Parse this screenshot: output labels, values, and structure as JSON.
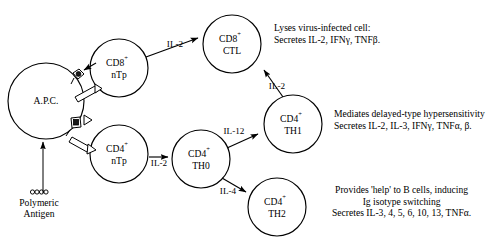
{
  "diagram": {
    "cells": [
      {
        "id": "apc",
        "name": "A.P.C.",
        "line1": "A.P.C.",
        "line2": "",
        "cx": 46,
        "cy": 101,
        "r": 38
      },
      {
        "id": "cd8ntp",
        "name": "CD8+ nTp",
        "line1": "CD8",
        "sup1": "+",
        "line2": "nTp",
        "cx": 119,
        "cy": 68,
        "r": 29
      },
      {
        "id": "cd4ntp",
        "name": "CD4+ nTp",
        "line1": "CD4",
        "sup1": "+",
        "line2": "nTp",
        "cx": 119,
        "cy": 154,
        "r": 29
      },
      {
        "id": "cd8ctl",
        "name": "CD8+ CTL",
        "line1": "CD8",
        "sup1": "+",
        "line2": "CTL",
        "cx": 232,
        "cy": 44,
        "r": 29
      },
      {
        "id": "cd4th0",
        "name": "CD4+ TH0",
        "line1": "CD4",
        "sup1": "+",
        "line2": "TH0",
        "cx": 201,
        "cy": 159,
        "r": 29
      },
      {
        "id": "cd4th1",
        "name": "CD4+ TH1",
        "line1": "CD4",
        "sup1": "+",
        "line2": "TH1",
        "cx": 293,
        "cy": 124,
        "r": 29
      },
      {
        "id": "cd4th2",
        "name": "CD4+ TH2",
        "line1": "CD4",
        "sup1": "+",
        "line2": "TH2",
        "cx": 277,
        "cy": 207,
        "r": 29
      }
    ],
    "cytokine_labels": [
      {
        "id": "il2-ctl",
        "text": "IL-2",
        "x": 175,
        "y": 44
      },
      {
        "id": "il2-th1",
        "text": "IL-2",
        "x": 276,
        "y": 86
      },
      {
        "id": "il2-th0",
        "text": "IL-2",
        "x": 159,
        "y": 163
      },
      {
        "id": "il12",
        "text": "IL-12",
        "x": 234,
        "y": 131
      },
      {
        "id": "il4",
        "text": "IL-4",
        "x": 228,
        "y": 191
      }
    ],
    "descriptions": [
      {
        "id": "ctl-description",
        "lines": [
          "Lyses virus-infected cell:",
          "Secretes IL-2, IFNγ, TNFβ."
        ],
        "x": 274,
        "y": 22,
        "align": "left"
      },
      {
        "id": "th1-description",
        "lines": [
          "Mediates delayed-type hypersensitivity",
          "Secretes IL-2, IL-3, IFNγ, TNFα, β."
        ],
        "x": 334,
        "y": 108,
        "align": "left"
      },
      {
        "id": "th2-description",
        "lines": [
          "Provides 'help' to B cells, inducing",
          "Ig isotype switching",
          "Secretes IL-3, 4, 5, 6, 10, 13, TNFα."
        ],
        "x": 332,
        "y": 184,
        "align": "center"
      }
    ],
    "antigen": {
      "id": "polymeric-antigen",
      "lines": [
        "Polymeric",
        "Antigen"
      ],
      "x": 13,
      "y": 198,
      "glyph": "oooo"
    }
  }
}
